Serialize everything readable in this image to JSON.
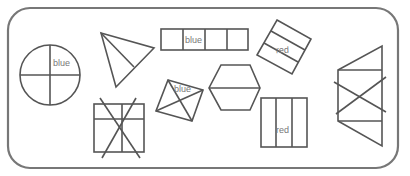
{
  "diagram": {
    "shapes": [
      {
        "id": "circle",
        "type": "circle",
        "parts": 4,
        "label": "blue"
      },
      {
        "id": "triangle",
        "type": "triangle",
        "parts": 2,
        "label": ""
      },
      {
        "id": "strip",
        "type": "rectangle",
        "parts": 4,
        "label": "blue"
      },
      {
        "id": "tilted-rect",
        "type": "rectangle",
        "parts": 3,
        "label": "red"
      },
      {
        "id": "diamond",
        "type": "quadrilateral",
        "parts": 4,
        "label": "blue"
      },
      {
        "id": "hexagon",
        "type": "hexagon",
        "parts": 2,
        "label": ""
      },
      {
        "id": "crossed-square",
        "type": "square",
        "parts": 4,
        "label": "",
        "crossed": true
      },
      {
        "id": "red-rect",
        "type": "rectangle",
        "parts": 3,
        "label": "red"
      },
      {
        "id": "crossed-trapezoid",
        "type": "trapezoid",
        "parts": 3,
        "label": "",
        "crossed": true
      }
    ]
  },
  "labels": {
    "circle": "blue",
    "strip": "blue",
    "tilted_rect": "red",
    "diamond": "blue",
    "red_rect": "red"
  }
}
